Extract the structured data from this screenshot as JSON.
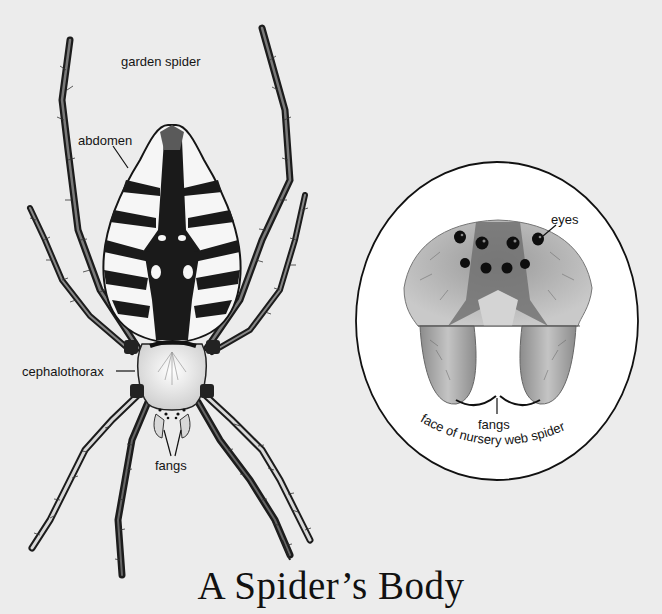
{
  "title": "A Spider’s Body",
  "garden_spider": {
    "caption": "garden spider",
    "labels": {
      "abdomen": "abdomen",
      "cephalothorax": "cephalothorax",
      "fangs": "fangs"
    }
  },
  "nursery_web_spider_inset": {
    "caption": "face of nursery web spider",
    "labels": {
      "eyes": "eyes",
      "fangs": "fangs"
    },
    "eye_count": 8
  },
  "colors": {
    "background": "#ececec",
    "ink": "#141414",
    "inset_fill": "#ffffff"
  }
}
